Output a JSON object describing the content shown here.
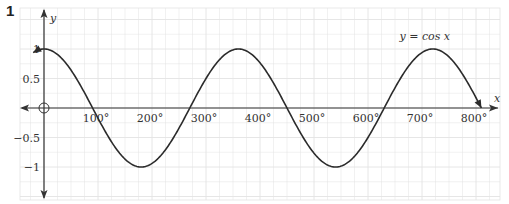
{
  "question_number": "1",
  "chart_data": {
    "type": "line",
    "title": "",
    "series": [
      {
        "name": "y = cos x",
        "function": "cos",
        "x_start": -20,
        "x_end": 810
      }
    ],
    "annotation": {
      "text": "y = cos x",
      "x": 720,
      "y": 1.08
    },
    "xlabel": "x",
    "ylabel": "y",
    "x_tick_labels": [
      "100°",
      "200°",
      "300°",
      "400°",
      "500°",
      "600°",
      "700°",
      "800°"
    ],
    "x_ticks": [
      100,
      200,
      300,
      400,
      500,
      600,
      700,
      800
    ],
    "y_tick_labels": [
      "1",
      "0.5",
      "−0.5",
      "−1"
    ],
    "y_ticks": [
      1,
      0.5,
      -0.5,
      -1
    ],
    "xlim": [
      -45,
      820
    ],
    "ylim": [
      -1.55,
      1.7
    ],
    "grid": true,
    "origin_marker": "circle",
    "curve_color": "#2b2b2b",
    "grid_color": "#e3e3e3",
    "axis_color": "#333333"
  }
}
